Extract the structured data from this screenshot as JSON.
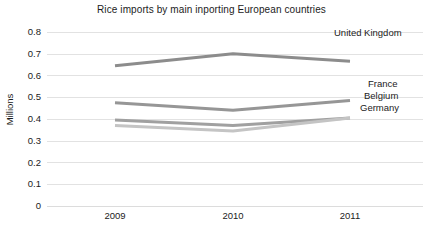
{
  "chart_data": {
    "type": "line",
    "title": "Rice imports by main inporting European countries",
    "xlabel": "",
    "ylabel": "Millions",
    "categories": [
      "2009",
      "2010",
      "2011"
    ],
    "ylim": [
      0,
      0.8
    ],
    "yticks": [
      "0.8",
      "0.7",
      "0.6",
      "0.5",
      "0.4",
      "0.3",
      "0.2",
      "0.1",
      "0"
    ],
    "ytick_values": [
      0.8,
      0.7,
      0.6,
      0.5,
      0.4,
      0.3,
      0.2,
      0.1,
      0
    ],
    "grid": true,
    "legend_position": "right-inline-labels",
    "series": [
      {
        "name": "United Kingdom",
        "color": "#8c8c8c",
        "values": [
          0.645,
          0.7,
          0.665
        ]
      },
      {
        "name": "France",
        "color": "#969696",
        "values": [
          0.475,
          0.44,
          0.485
        ]
      },
      {
        "name": "Belgium",
        "color": "#a0a0a0",
        "values": [
          0.395,
          0.37,
          0.405
        ]
      },
      {
        "name": "Germany",
        "color": "#c4c4c4",
        "values": [
          0.37,
          0.345,
          0.405
        ]
      }
    ]
  }
}
